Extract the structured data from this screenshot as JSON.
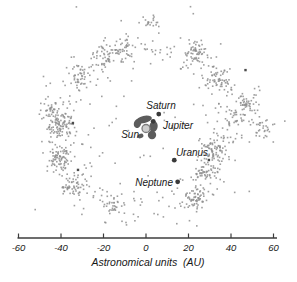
{
  "figure": {
    "background": "#ffffff"
  },
  "chart_data": {
    "type": "scatter",
    "title": "",
    "xlabel": "Astronomical units  (AU)",
    "ylabel": "",
    "x_axis": {
      "ticks": [
        -60,
        -40,
        -20,
        0,
        20,
        40,
        60
      ],
      "range": [
        -61,
        61
      ]
    },
    "grid": false,
    "legend": false,
    "scale_px_per_au": 2.125,
    "center_px": {
      "x": 146,
      "y": 128.5
    },
    "axis_y_px": 238,
    "axis_x1_px": 17.5,
    "axis_x2_px": 277,
    "seed": 20240601,
    "dot_size_px": 1.6,
    "colors": {
      "dot": "#8e8e8e",
      "dark_dot": "#4b4b4b",
      "planet": "#3a3a3a",
      "sun_fill": "#cdcdcd",
      "sun_stroke": "#7d7d7d",
      "inner_cluster": "#5c5c5c",
      "text": "#181818",
      "axis": "#3c3c3c"
    },
    "belt": {
      "n_base": 300,
      "r_mean_au": 39,
      "r_sigma_au": 5.5,
      "r_min_au": 27,
      "r_max_au": 56
    },
    "clumps": [
      {
        "x": -39.5,
        "y": 1.6,
        "sigma": 3.2,
        "n": 90
      },
      {
        "x": -40.5,
        "y": -14.8,
        "sigma": 3.4,
        "n": 80
      },
      {
        "x": -34.8,
        "y": -27.1,
        "sigma": 2.8,
        "n": 50
      },
      {
        "x": -45.2,
        "y": 8.7,
        "sigma": 2.6,
        "n": 40
      },
      {
        "x": -31.1,
        "y": 25.2,
        "sigma": 3.0,
        "n": 40
      },
      {
        "x": -19.3,
        "y": 34.6,
        "sigma": 2.8,
        "n": 40
      },
      {
        "x": -9.9,
        "y": 37.9,
        "sigma": 2.4,
        "n": 30
      },
      {
        "x": 2.8,
        "y": 50.1,
        "sigma": 2.2,
        "n": 18
      },
      {
        "x": 23.1,
        "y": 36.0,
        "sigma": 2.8,
        "n": 55
      },
      {
        "x": 35.8,
        "y": 22.8,
        "sigma": 3.0,
        "n": 50
      },
      {
        "x": 48.0,
        "y": 13.4,
        "sigma": 2.8,
        "n": 45
      },
      {
        "x": 54.6,
        "y": 0.2,
        "sigma": 2.6,
        "n": 32
      },
      {
        "x": 41.9,
        "y": 4.0,
        "sigma": 3.0,
        "n": 35
      },
      {
        "x": 32.5,
        "y": -10.1,
        "sigma": 2.8,
        "n": 70
      },
      {
        "x": 27.8,
        "y": -20.5,
        "sigma": 2.6,
        "n": 50
      },
      {
        "x": 23.5,
        "y": -32.7,
        "sigma": 2.4,
        "n": 55
      },
      {
        "x": -16.0,
        "y": -35.5,
        "sigma": 2.4,
        "n": 28
      }
    ],
    "inner_scatter": {
      "n": 28,
      "r_min_au": 8,
      "r_max_au": 26
    },
    "outliers": {
      "n": 12,
      "r_min_au": 50,
      "r_max_au": 66
    },
    "extra_points": [
      {
        "x": 65.3,
        "y": 3.5
      }
    ],
    "dark_spots": [
      {
        "x": -34.4,
        "y": 2.6
      },
      {
        "x": -32.0,
        "y": -19.5
      },
      {
        "x": 46.8,
        "y": 27.5
      },
      {
        "x": 29.6,
        "y": -14.8
      }
    ],
    "inner_cluster_blobs": [
      {
        "dx": -2.0,
        "dy": -9.0,
        "rx": 8.0,
        "ry": 3.6,
        "rot": -12
      },
      {
        "dx": -8.5,
        "dy": -5.0,
        "rx": 3.6,
        "ry": 4.6,
        "rot": 20
      },
      {
        "dx": 7.5,
        "dy": -2.0,
        "rx": 4.2,
        "ry": 5.6,
        "rot": 8
      },
      {
        "dx": 6.0,
        "dy": 6.5,
        "rx": 4.2,
        "ry": 4.2,
        "rot": 0
      },
      {
        "dx": -5.5,
        "dy": 7.5,
        "rx": 3.0,
        "ry": 2.2,
        "rot": -20
      }
    ],
    "planets": [
      {
        "name": "sun",
        "label": "Sun",
        "x_au": 0,
        "y_au": 0,
        "type": "sun",
        "r_px": 4,
        "label_x": 139,
        "label_y": 138,
        "anchor": "end"
      },
      {
        "name": "jupiter",
        "label": "Jupiter",
        "x_au": 3.4,
        "y_au": 3.4,
        "type": "planet",
        "r_px": 2.4,
        "label_x": 163,
        "label_y": 128.5,
        "anchor": "start"
      },
      {
        "name": "saturn",
        "label": "Saturn",
        "x_au": 6.0,
        "y_au": 6.8,
        "type": "planet",
        "r_px": 2.4,
        "label_x": 161,
        "label_y": 109,
        "anchor": "middle"
      },
      {
        "name": "uranus",
        "label": "Uranus",
        "x_au": 13.3,
        "y_au": -14.9,
        "type": "planet",
        "r_px": 2.4,
        "label_x": 192,
        "label_y": 155.5,
        "anchor": "middle"
      },
      {
        "name": "neptune",
        "label": "Neptune",
        "x_au": 14.9,
        "y_au": -25.1,
        "type": "planet",
        "r_px": 2.4,
        "label_x": 173,
        "label_y": 186,
        "anchor": "end"
      }
    ]
  }
}
